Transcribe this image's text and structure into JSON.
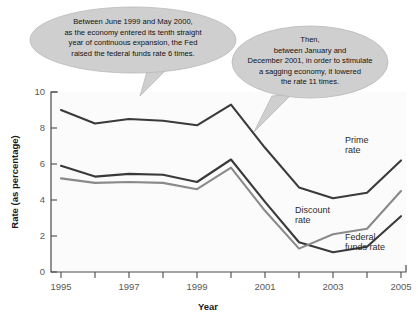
{
  "chart_data": {
    "type": "line",
    "title": "",
    "xlabel": "Year",
    "ylabel": "Rate (as percentage)",
    "xlim": [
      1995,
      2005
    ],
    "ylim": [
      0,
      10
    ],
    "grid": false,
    "legend_position": "inline-right",
    "x": [
      1995,
      1996,
      1997,
      1998,
      1999,
      2000,
      2001,
      2002,
      2003,
      2004,
      2005
    ],
    "xticklabels": [
      "1995",
      "",
      "1997",
      "",
      "1999",
      "",
      "2001",
      "",
      "2003",
      "",
      "2005"
    ],
    "yticklabels": [
      "0",
      "2",
      "4",
      "6",
      "8",
      "10"
    ],
    "yticks": [
      0,
      2,
      4,
      6,
      8,
      10
    ],
    "series": [
      {
        "name": "Prime rate",
        "label_line1": "Prime",
        "label_line2": "rate",
        "color": "#3a3a3a",
        "values": [
          9.0,
          8.25,
          8.5,
          8.4,
          8.15,
          9.3,
          6.9,
          4.7,
          4.1,
          4.4,
          6.2
        ]
      },
      {
        "name": "Federal funds rate",
        "label_line1": "Federal",
        "label_line2": "funds rate",
        "color": "#3a3a3a",
        "values": [
          5.9,
          5.3,
          5.45,
          5.4,
          5.0,
          6.25,
          3.9,
          1.65,
          1.1,
          1.4,
          3.1
        ]
      },
      {
        "name": "Discount rate",
        "label_line1": "Discount",
        "label_line2": "rate",
        "color": "#8a8a8a",
        "values": [
          5.2,
          4.95,
          5.0,
          4.95,
          4.6,
          5.8,
          3.4,
          1.3,
          2.1,
          2.4,
          4.5
        ]
      }
    ],
    "annotations": [
      {
        "id": "callout-left",
        "lines": [
          "Between June 1999 and May 2000,",
          "as the economy entered its tenth straight",
          "year of continuous expansion, the Fed",
          "raised the federal funds rate 6 times."
        ]
      },
      {
        "id": "callout-right",
        "lines": [
          "Then,",
          "between January and",
          "December 2001, in order to stimulate",
          "a sagging economy, it lowered",
          "the rate 11 times."
        ]
      }
    ]
  },
  "axes": {
    "ylabel": "Rate (as percentage)",
    "xlabel": "Year"
  },
  "colors": {
    "dark_line": "#3a3a3a",
    "gray_line": "#8a8a8a",
    "callout_fill": "#cfcfcf",
    "axis": "#4a4a4a",
    "background": "#ffffff"
  }
}
